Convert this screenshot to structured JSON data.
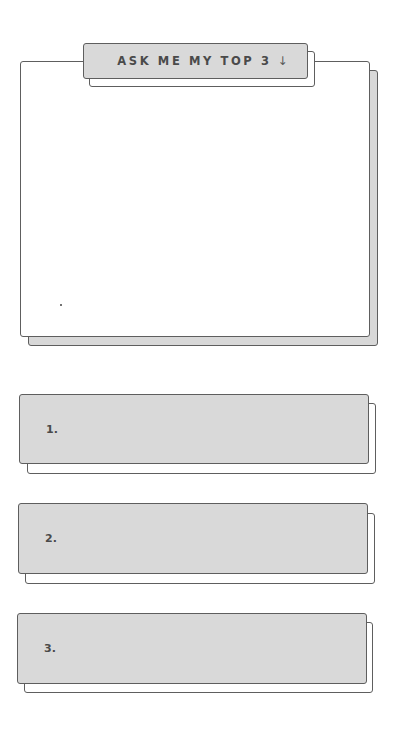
{
  "prompt_card": {
    "header": {
      "label": "ASK ME MY TOP 3",
      "arrow": "↓",
      "arrow_icon": "arrow-down-icon"
    },
    "body_text": ""
  },
  "ranking": {
    "items": [
      {
        "rank": "1.",
        "value": ""
      },
      {
        "rank": "2.",
        "value": ""
      },
      {
        "rank": "3.",
        "value": ""
      }
    ]
  },
  "colors": {
    "background": "#ffffff",
    "panel_fill": "#d9d9d9",
    "border": "#5e5e5e",
    "text": "#4a4a4a"
  }
}
